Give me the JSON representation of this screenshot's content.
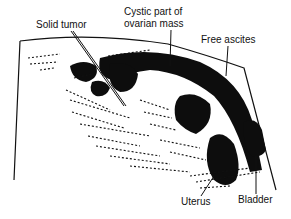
{
  "diagram": {
    "type": "annotated ultrasound sketch",
    "labels": {
      "solid_tumor": "Solid tumor",
      "cystic_part_line1": "Cystic part of",
      "cystic_part_line2": "ovarian mass",
      "free_ascites": "Free ascites",
      "uterus": "Uterus",
      "bladder": "Bladder"
    },
    "colors": {
      "ink": "#111111",
      "background": "#ffffff"
    }
  }
}
